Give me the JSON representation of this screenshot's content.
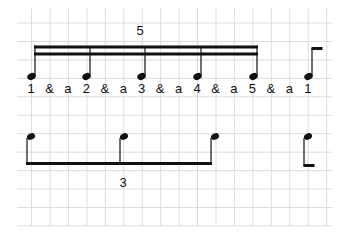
{
  "grid": {
    "color": "#d6d6d6",
    "x0": 17,
    "x1": 332,
    "y0": 8,
    "y1": 226,
    "spacing": 18.45,
    "offset_x": 31.5,
    "offset_y": 23
  },
  "line1": {
    "tuplet_label": "5",
    "counts": [
      "1",
      "&",
      "a",
      "2",
      "&",
      "a",
      "3",
      "&",
      "a",
      "4",
      "&",
      "a",
      "5",
      "&",
      "a",
      "1"
    ],
    "notes": [
      {
        "name": "note-1",
        "x": 35
      },
      {
        "name": "note-2",
        "x": 90
      },
      {
        "name": "note-3",
        "x": 145
      },
      {
        "name": "note-4",
        "x": 201
      },
      {
        "name": "note-5",
        "x": 256
      },
      {
        "name": "note-6-pickup",
        "x": 311
      }
    ]
  },
  "line2": {
    "tuplet_label": "3",
    "notes": [
      {
        "name": "note-1",
        "x": 30
      },
      {
        "name": "note-2",
        "x": 123
      },
      {
        "name": "note-3",
        "x": 215
      },
      {
        "name": "note-4",
        "x": 308
      }
    ]
  },
  "colors": {
    "ink": "#111111"
  }
}
